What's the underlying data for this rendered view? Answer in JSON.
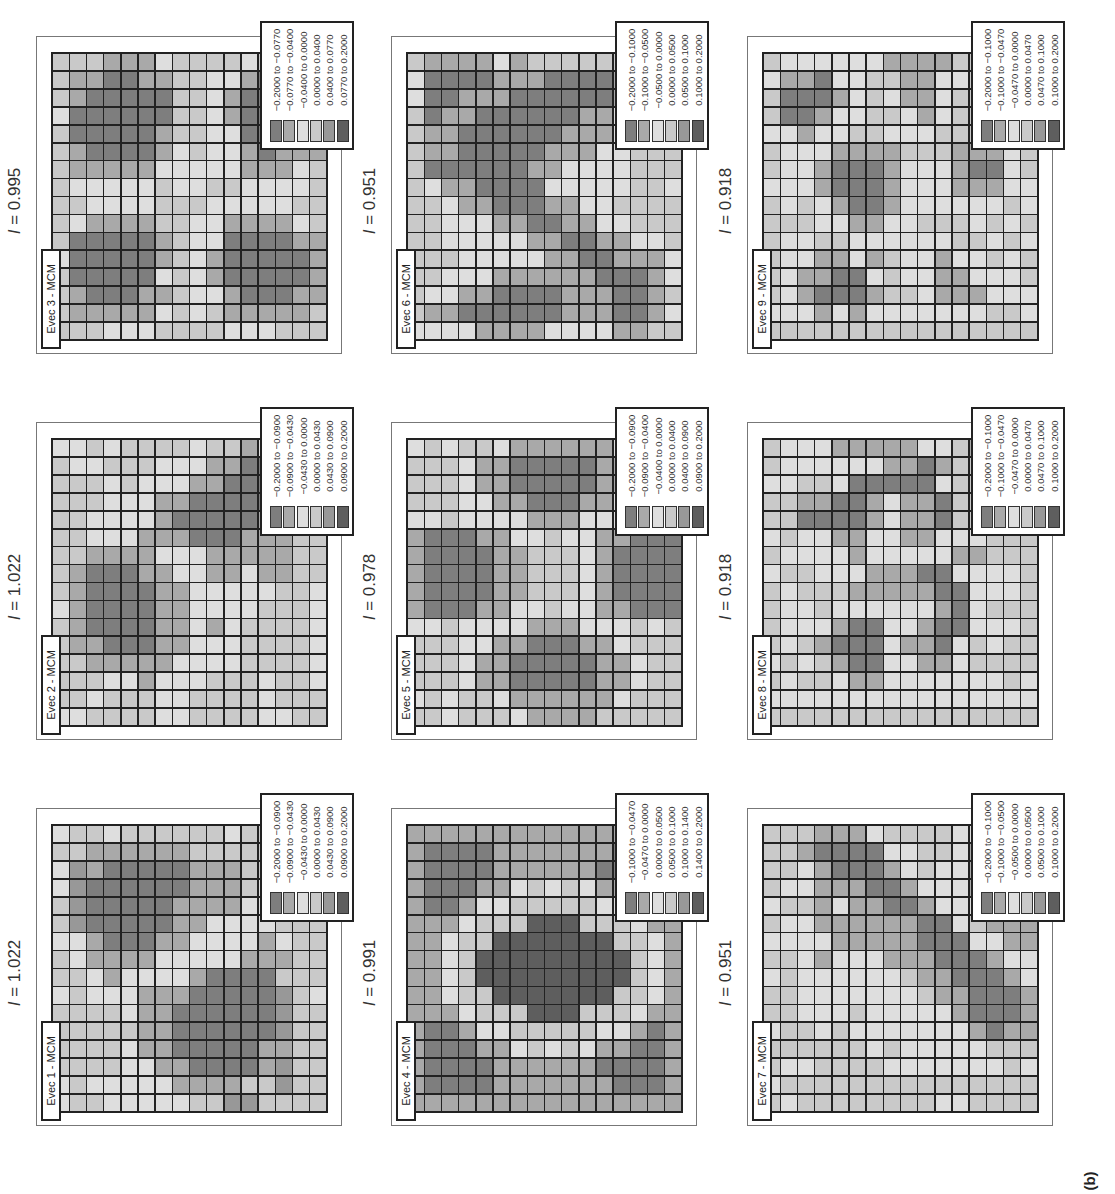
{
  "figure_label": "(b)",
  "gray_levels": [
    "#7e7e7e",
    "#a9a9a9",
    "#dedede",
    "#c9c9c9",
    "#989898",
    "#5e5e5e"
  ],
  "chart_data": {
    "type": "heatmap",
    "title": "",
    "orientation_note": "Figure rendered rotated 90° counter-clockwise",
    "grid_size": [
      16,
      16
    ],
    "panels": [
      {
        "name": "Evec 1 - MCM",
        "I_label": "I = 1.022",
        "I_value": 1.022,
        "legend": [
          "-0.2000 to -0.0900",
          "-0.0900 to -0.0430",
          "-0.0430 to 0.0000",
          "0.0000 to 0.0430",
          "0.0430 to 0.0900",
          "0.0900 to 0.2000"
        ]
      },
      {
        "name": "Evec 2 - MCM",
        "I_label": "I = 1.022",
        "I_value": 1.022,
        "legend": [
          "-0.2000 to -0.0900",
          "-0.0900 to -0.0430",
          "-0.0430 to 0.0000",
          "0.0000 to 0.0430",
          "0.0430 to 0.0900",
          "0.0900 to 0.2000"
        ]
      },
      {
        "name": "Evec 3 - MCM",
        "I_label": "I = 0.995",
        "I_value": 0.995,
        "legend": [
          "-0.2000 to -0.0770",
          "-0.0770 to -0.0400",
          "-0.0400 to 0.0000",
          "0.0000 to 0.0400",
          "0.0400 to 0.0770",
          "0.0770 to 0.2000"
        ]
      },
      {
        "name": "Evec 4 - MCM",
        "I_label": "I = 0.991",
        "I_value": 0.991,
        "legend": [
          "-0.1000 to -0.0470",
          "-0.0470 to 0.0000",
          "0.0000 to 0.0500",
          "0.0500 to 0.1000",
          "0.1000 to 0.1400",
          "0.1400 to 0.2000"
        ]
      },
      {
        "name": "Evec 5 - MCM",
        "I_label": "I = 0.978",
        "I_value": 0.978,
        "legend": [
          "-0.2000 to -0.0900",
          "-0.0900 to -0.0400",
          "-0.0400 to 0.0000",
          "0.0000 to 0.0400",
          "0.0400 to 0.0900",
          "0.0900 to 0.2000"
        ]
      },
      {
        "name": "Evec 6 - MCM",
        "I_label": "I = 0.951",
        "I_value": 0.951,
        "legend": [
          "-0.2000 to -0.1000",
          "-0.1000 to -0.0500",
          "-0.0500 to 0.0000",
          "0.0000 to 0.0500",
          "0.0500 to 0.1000",
          "0.1000 to 0.2000"
        ]
      },
      {
        "name": "Evec 7 - MCM",
        "I_label": "I = 0.951",
        "I_value": 0.951,
        "legend": [
          "-0.2000 to -0.1000",
          "-0.1000 to -0.0500",
          "-0.0500 to 0.0000",
          "0.0000 to 0.0500",
          "0.0500 to 0.1000",
          "0.1000 to 0.2000"
        ]
      },
      {
        "name": "Evec 8 - MCM",
        "I_label": "I = 0.918",
        "I_value": 0.918,
        "legend": [
          "-0.2000 to -0.1000",
          "-0.1000 to -0.0470",
          "-0.0470 to 0.0000",
          "0.0000 to 0.0470",
          "0.0470 to 0.1000",
          "0.1000 to 0.2000"
        ]
      },
      {
        "name": "Evec 9 - MCM",
        "I_label": "I = 0.918",
        "I_value": 0.918,
        "legend": [
          "-0.2000 to -0.1000",
          "-0.1000 to -0.0470",
          "-0.0470 to 0.0000",
          "0.0000 to 0.0470",
          "0.0470 to 0.1000",
          "0.1000 to 0.2000"
        ]
      }
    ]
  },
  "screen_panels": [
    {
      "pos": [
        36,
        808
      ],
      "panel_index": 0
    },
    {
      "pos": [
        36,
        422
      ],
      "panel_index": 1
    },
    {
      "pos": [
        36,
        36
      ],
      "panel_index": 2
    },
    {
      "pos": [
        391,
        808
      ],
      "panel_index": 3
    },
    {
      "pos": [
        391,
        422
      ],
      "panel_index": 4
    },
    {
      "pos": [
        391,
        36
      ],
      "panel_index": 5
    },
    {
      "pos": [
        747,
        808
      ],
      "panel_index": 6
    },
    {
      "pos": [
        747,
        422
      ],
      "panel_index": 7
    },
    {
      "pos": [
        747,
        36
      ],
      "panel_index": 8
    }
  ],
  "grids": {
    "0": [
      "2332333333233222",
      "3311111133333233",
      "2410000011133432",
      "2400000011132432",
      "3400000111122332",
      "3400000112222333",
      "2210001122221233",
      "3211112222211133",
      "3321222210000333",
      "2322211100000432",
      "3333211000000433",
      "3333311000000433",
      "3333211000001133",
      "3333221100001433",
      "2322222111133433",
      "2332222233443333"
    ],
    "1": [
      "2232333323312332",
      "3223332221100133",
      "3332322211000033",
      "3332221100000133",
      "3322221000001133",
      "3322211100011133",
      "3311112221111133",
      "3100011221121133",
      "3100001122222332",
      "2100001122223332",
      "3100001121233332",
      "3110001122233332",
      "3311111222233332",
      "3332212223332332",
      "3323332233332333",
      "2233332233332233"
    ],
    "2": [
      "3331112333323333",
      "3110011332210111",
      "3100000332100011",
      "2000000332100001",
      "3000001332200001",
      "3100001232210111",
      "3111112222211123",
      "3222223223322223",
      "3322223332222233",
      "3211113322111123",
      "3000001322000011",
      "2000001321000001",
      "3000002321000001",
      "3100011322100011",
      "3111112323111113",
      "3332223333222333"
    ],
    "3": [
      "1111111111111111",
      "1000011111110001",
      "1000011111100001",
      "1000112323211001",
      "1001223333322101",
      "1112333555333211",
      "1123355555553321",
      "1123555555555321",
      "1123555555555321",
      "1123355555553321",
      "1112333555333211",
      "1001223333322101",
      "1000112323211001",
      "1000011111100001",
      "1000011111110001",
      "1111111111111111"
    ],
    "4": [
      "2323321111112333",
      "3332110000011233",
      "3332110000011233",
      "3332211000112333",
      "2232222111222323",
      "1000112232211000",
      "1000011333210000",
      "1000011333210000",
      "1000011333210000",
      "1000112232211000",
      "2232222111222323",
      "3332211000112333",
      "3332110000011233",
      "3332110000011233",
      "2323321111112333",
      "3323332111133333"
    ],
    "5": [
      "3111121333333333",
      "2000011100001112",
      "2001110000001123",
      "3011000000112233",
      "3110000001112233",
      "3110000011122333",
      "3000000112222333",
      "3211000022222332",
      "3321100011223333",
      "3322211001122333",
      "3322222110011223",
      "3332222211001112",
      "3322211111100012",
      "3221100001110013",
      "3110000001110012",
      "2222111122221133"
    ],
    "6": [
      "3331112333322111",
      "3310000223321000",
      "3321000123221000",
      "3221110012221100",
      "2331211001222211",
      "3221111110023111",
      "2222111110002211",
      "3321222111000122",
      "2322222231100012",
      "3322222223110001",
      "3322232222210001",
      "2332322222221011",
      "3333332322222333",
      "3223333222222232",
      "2333333333333333",
      "3233333333223333"
    ],
    "7": [
      "3222111112231233",
      "3222222110133333",
      "2233200000233333",
      "3311001211033232",
      "3300001211033223",
      "2322112211222333",
      "3222212222211333",
      "2332221110022223",
      "3233311111002223",
      "3223222222102333",
      "3222100221002223",
      "3231000211023233",
      "2323100221123333",
      "3233211222222232",
      "2222222222222222",
      "3333333333333333"
    ],
    "8": [
      "3222222111133133",
      "2110223311223213",
      "3000123211233221",
      "3001223321233331",
      "2212233222333232",
      "3222111133311123",
      "3221000122210023",
      "2221000122211122",
      "3232100122222232",
      "3332211223332323",
      "3223322222233232",
      "3221121322122323",
      "3211002322112223",
      "3210001332111222",
      "2221212222222332",
      "3333333333333333"
    ]
  }
}
